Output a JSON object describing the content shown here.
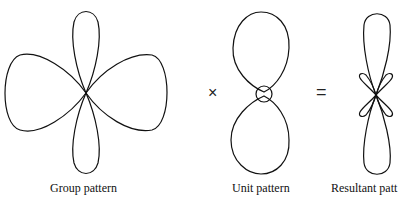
{
  "diagram": {
    "panels": [
      {
        "id": "group",
        "label": "Group pattern"
      },
      {
        "id": "unit",
        "label": "Unit pattern"
      },
      {
        "id": "resultant",
        "label": "Resultant patt"
      }
    ],
    "operators": {
      "multiply": "×",
      "equals": "="
    },
    "colors": {
      "stroke": "#111111",
      "background": "#ffffff"
    }
  }
}
